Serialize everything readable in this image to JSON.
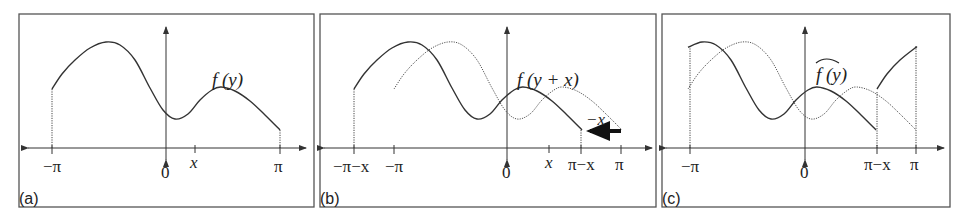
{
  "figure": {
    "panels": [
      {
        "id": "a",
        "label": "(a)",
        "function_label": "f (y)",
        "ticks": [
          {
            "text": "−π",
            "x": 52
          },
          {
            "text": "0",
            "x": 166
          },
          {
            "text": "x",
            "x": 195,
            "italic": true
          },
          {
            "text": "π",
            "x": 280
          }
        ]
      },
      {
        "id": "b",
        "label": "(b)",
        "function_label": "f (y + x)",
        "shift_label": "−x",
        "ticks": [
          {
            "text": "−π−x",
            "x": 354
          },
          {
            "text": "−π",
            "x": 394
          },
          {
            "text": "0",
            "x": 507
          },
          {
            "text": "x",
            "x": 549,
            "italic": true
          },
          {
            "text": "π−x",
            "x": 581
          },
          {
            "text": "π",
            "x": 621
          }
        ]
      },
      {
        "id": "c",
        "label": "(c)",
        "function_label": "f (y)",
        "function_label_accent": "wide-hat",
        "ticks": [
          {
            "text": "−π",
            "x": 690
          },
          {
            "text": "0",
            "x": 805
          },
          {
            "text": "π−x",
            "x": 877
          },
          {
            "text": "π",
            "x": 916
          }
        ]
      }
    ],
    "base_curve_f_y": [
      [
        52,
        89
      ],
      [
        62,
        74
      ],
      [
        75,
        60
      ],
      [
        90,
        48
      ],
      [
        106,
        42
      ],
      [
        120,
        45
      ],
      [
        135,
        60
      ],
      [
        150,
        88
      ],
      [
        163,
        110
      ],
      [
        175,
        119
      ],
      [
        188,
        114
      ],
      [
        200,
        100
      ],
      [
        212,
        90
      ],
      [
        221,
        87
      ],
      [
        235,
        91
      ],
      [
        250,
        101
      ],
      [
        265,
        115
      ],
      [
        280,
        130
      ]
    ],
    "colors": {
      "stroke": "#333333",
      "frame": "#555555",
      "background": "#ffffff"
    }
  }
}
